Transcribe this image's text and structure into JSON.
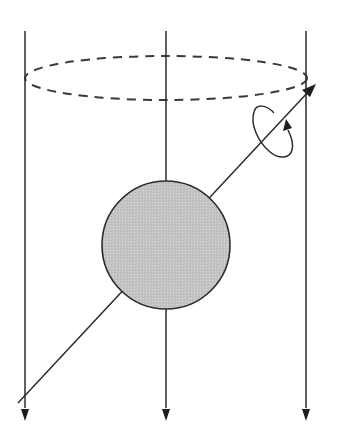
{
  "diagram": {
    "colors": {
      "stroke": "#2b2b2b",
      "sphere_fill": "#c4c4c4",
      "background": "#ffffff"
    },
    "field_lines": [
      {
        "x": 25,
        "y_top": 31,
        "y_bottom": 420,
        "direction": "down"
      },
      {
        "x": 166,
        "y_top": 31,
        "y_bottom": 420,
        "direction": "down"
      },
      {
        "x": 306,
        "y_top": 31,
        "y_bottom": 420,
        "direction": "down"
      }
    ],
    "dashed_ellipse": {
      "cx": 166,
      "cy": 78,
      "rx": 141,
      "ry": 22
    },
    "sphere": {
      "cx": 166,
      "cy": 245,
      "r": 64
    },
    "rotation_axis": {
      "x1": 18,
      "y1": 403,
      "x2": 315,
      "y2": 85
    },
    "rotation_loop": {
      "cx": 266,
      "cy": 124,
      "rx": 27,
      "ry": 13,
      "rotate": -52
    }
  }
}
